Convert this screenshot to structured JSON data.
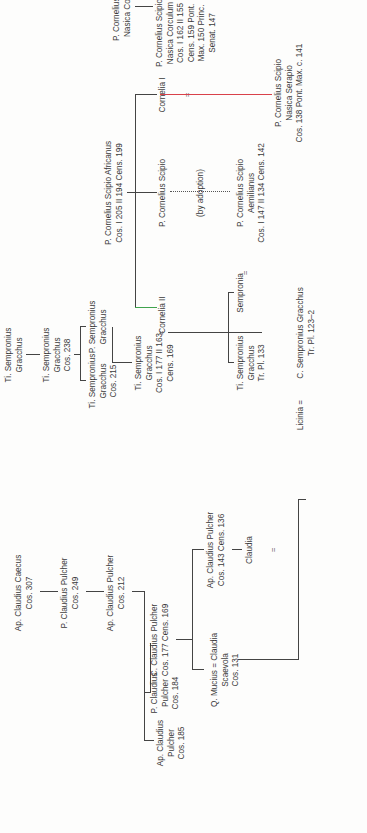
{
  "diagram": {
    "type": "genealogical-tree",
    "orientation": "rotated-90-ccw",
    "colors": {
      "text": "#3a3a3a",
      "lines": "#444444",
      "red_marriage_line": "#d9414a",
      "green_link_line": "#3fa34d"
    },
    "claudii": {
      "caecus": [
        "Ap. Claudius Caecus",
        "Cos. 307"
      ],
      "p_pulcher_249": [
        "P. Claudius Pulcher",
        "Cos. 249"
      ],
      "ap_pulcher_212": [
        "Ap. Claudius Pulcher",
        "Cos. 212"
      ],
      "ap_pulcher_185": [
        "Ap. Claudius",
        "Pulcher",
        "Cos. 185"
      ],
      "p_pulcher_184": [
        "P. Claudius",
        "Pulcher",
        "Cos. 184"
      ],
      "c_pulcher_177": [
        "C. Claudius Pulcher",
        "Cos. 177 Cens. 169"
      ],
      "ap_pulcher_143": [
        "Ap. Claudius Pulcher",
        "Cos. 143 Cens. 136"
      ],
      "mucius": [
        "Q. Mucius = Claudia",
        "Scaevola",
        "Cos. 131"
      ],
      "claudia": [
        "Claudia"
      ]
    },
    "gracchi": {
      "ti_gen1": [
        "Ti. Sempronius",
        "Gracchus"
      ],
      "ti_238": [
        "Ti. Sempronius",
        "Gracchus",
        "Cos. 238"
      ],
      "ti_215": [
        "Ti. Sempronius",
        "Gracchus",
        "Cos. 215"
      ],
      "p_gracchus": [
        "P. Sempronius",
        "Gracchus"
      ],
      "ti_177": [
        "Ti. Sempronius",
        "Gracchus",
        "Cos. I 177 II 163",
        "Cens. 169"
      ],
      "cornelia_ii": [
        "Cornelia II"
      ],
      "ti_133": [
        "Ti. Sempronius",
        "Gracchus",
        "Tr. Pl. 133"
      ],
      "sempronia": [
        "Sempronia"
      ],
      "c_gracchus": [
        "C. Sempronius Gracchus",
        "Tr. Pl. 123–2"
      ],
      "licinia": [
        "Licinia ="
      ]
    },
    "scipiones": {
      "africanus": [
        "P. Cornelius Scipio Africanus",
        "Cos. I 205 II 194 Cens. 199"
      ],
      "p_scipio": [
        "P. Cornelius Scipio"
      ],
      "adoption_note": "(by adoption)",
      "aemilianus": [
        "P. Cornelius Scipio",
        "Aemilianus",
        "Cos. I 147 II 134 Cens. 142"
      ],
      "cornelia_i": [
        "Cornelia I"
      ],
      "nasica_191": [
        "P. Cornelius Scipio",
        "Nasica Cos. 191"
      ],
      "corculum": [
        "P. Cornelius Scipio",
        "Nasica Corculum",
        "Cos. I 162 II 155",
        "Cens. 159 Pont.",
        "Max. 150 Princ.",
        "Senat. 147"
      ],
      "serapio": [
        "P. Cornelius Scipio",
        "Nasica Serapio",
        "Cos. 138 Pont. Max. c. 141"
      ]
    },
    "marriage_sign": "="
  }
}
